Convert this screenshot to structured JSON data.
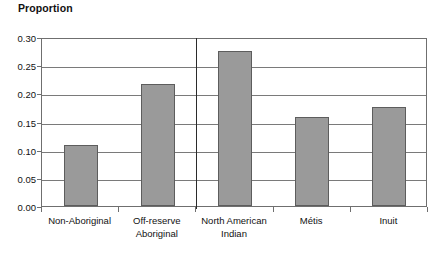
{
  "chart_data": {
    "type": "bar",
    "title": "Proportion",
    "xlabel": "",
    "ylabel": "Proportion",
    "categories": [
      "Non-Aboriginal",
      "Off-reserve\nAboriginal",
      "North American\nIndian",
      "Métis",
      "Inuit"
    ],
    "values": [
      0.109,
      0.217,
      0.275,
      0.158,
      0.176
    ],
    "ylim": [
      0.0,
      0.3
    ],
    "yticks": [
      0.0,
      0.05,
      0.1,
      0.15,
      0.2,
      0.25,
      0.3
    ],
    "ytick_labels": [
      "0.00",
      "0.05",
      "0.10",
      "0.15",
      "0.20",
      "0.25",
      "0.30"
    ],
    "grid": true,
    "legend": null,
    "bar_color": "#9a9a9a",
    "bar_border_color": "#5d5d5d",
    "grid_color": "#7a7a7a",
    "frame_color": "#6f6f6f",
    "divider_color": "#2b2b2b",
    "divider_after_category_index": 1,
    "annotations": []
  }
}
